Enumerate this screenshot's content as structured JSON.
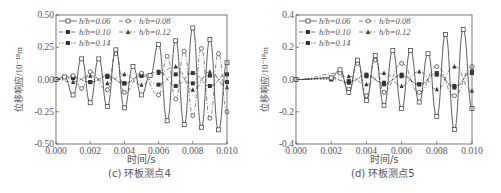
{
  "chart_data": [
    {
      "type": "line",
      "caption": "(c) 环板测点4",
      "xlabel": "时间/s",
      "ylabel": "位移响应/10⁻¹⁸m",
      "xlim": [
        0.0,
        0.01
      ],
      "ylim": [
        -0.5,
        0.5
      ],
      "xticks": [
        "0.000",
        "0.002",
        "0.004",
        "0.006",
        "0.008",
        "0.010"
      ],
      "yticks": [
        "0.50",
        "0.25",
        "0.00",
        "-0.25",
        "-0.50"
      ],
      "legend": [
        "h/b=0.06",
        "h/b=0.08",
        "h/b=0.10",
        "h/b=0.12",
        "h/b=0.14"
      ],
      "legend_position": "upper left",
      "series": [
        {
          "name": "h/b=0.06",
          "marker": "square-open",
          "line": "solid",
          "x": [
            0.0,
            0.0005,
            0.001,
            0.0015,
            0.002,
            0.0025,
            0.003,
            0.0035,
            0.004,
            0.0045,
            0.005,
            0.0055,
            0.006,
            0.0065,
            0.007,
            0.0075,
            0.008,
            0.0085,
            0.009,
            0.0095,
            0.01
          ],
          "y": [
            0.0,
            0.02,
            -0.12,
            0.16,
            -0.18,
            0.16,
            -0.21,
            0.23,
            -0.22,
            0.1,
            -0.12,
            0.03,
            0.27,
            -0.32,
            0.3,
            -0.35,
            0.4,
            -0.37,
            0.31,
            -0.39,
            0.13
          ]
        },
        {
          "name": "h/b=0.08",
          "marker": "circle-open",
          "line": "dash-dot",
          "x": [
            0.0,
            0.001,
            0.0015,
            0.002,
            0.003,
            0.0035,
            0.004,
            0.005,
            0.006,
            0.0065,
            0.007,
            0.0075,
            0.008,
            0.0085,
            0.009,
            0.0095,
            0.01
          ],
          "y": [
            0.0,
            0.03,
            -0.07,
            0.06,
            -0.08,
            0.2,
            -0.1,
            0.05,
            -0.12,
            0.18,
            -0.15,
            0.22,
            -0.28,
            0.24,
            -0.3,
            0.2,
            -0.25
          ]
        },
        {
          "name": "h/b=0.10",
          "marker": "square-filled",
          "line": "dashed",
          "x": [
            0.0,
            0.001,
            0.002,
            0.003,
            0.004,
            0.005,
            0.006,
            0.007,
            0.008,
            0.009,
            0.01
          ],
          "y": [
            0.0,
            0.02,
            -0.02,
            0.03,
            -0.03,
            0.03,
            0.06,
            -0.05,
            0.05,
            -0.05,
            0.04
          ]
        },
        {
          "name": "h/b=0.12",
          "marker": "triangle-filled",
          "line": "dash-dot",
          "x": [
            0.0,
            0.001,
            0.002,
            0.003,
            0.004,
            0.005,
            0.006,
            0.007,
            0.008,
            0.009,
            0.01
          ],
          "y": [
            0.0,
            -0.02,
            0.03,
            -0.03,
            0.04,
            -0.04,
            0.05,
            0.1,
            -0.08,
            0.06,
            -0.06
          ]
        },
        {
          "name": "h/b=0.14",
          "marker": "square-filled",
          "line": "dotted",
          "x": [
            0.0,
            0.001,
            0.002,
            0.003,
            0.004,
            0.005,
            0.006,
            0.007,
            0.008,
            0.009,
            0.01
          ],
          "y": [
            0.0,
            0.01,
            -0.02,
            0.02,
            -0.03,
            0.03,
            -0.04,
            0.04,
            -0.03,
            0.03,
            -0.02
          ]
        }
      ]
    },
    {
      "type": "line",
      "caption": "(d) 环板测点5",
      "xlabel": "时间/s",
      "ylabel": "位移响应/10⁻¹⁸m",
      "xlim": [
        0.0,
        0.01
      ],
      "ylim": [
        -0.4,
        0.4
      ],
      "xticks": [
        "0.000",
        "0.002",
        "0.004",
        "0.006",
        "0.008",
        "0.010"
      ],
      "yticks": [
        "0.4",
        "0.2",
        "0.0",
        "-0.2",
        "-0.4"
      ],
      "legend": [
        "h/b=0.06",
        "h/b=0.08",
        "h/b=0.10",
        "h/b=0.12",
        "h/b=0.14"
      ],
      "legend_position": "upper left",
      "series": [
        {
          "name": "h/b=0.06",
          "marker": "square-open",
          "line": "solid",
          "x": [
            0.0,
            0.002,
            0.0025,
            0.003,
            0.0035,
            0.004,
            0.0045,
            0.005,
            0.0055,
            0.006,
            0.0065,
            0.007,
            0.0075,
            0.008,
            0.0085,
            0.009,
            0.0095,
            0.01
          ],
          "y": [
            0.0,
            0.01,
            0.06,
            -0.08,
            0.12,
            -0.13,
            0.15,
            -0.16,
            0.18,
            -0.18,
            0.18,
            -0.14,
            0.16,
            -0.23,
            0.28,
            -0.31,
            0.31,
            -0.18
          ]
        },
        {
          "name": "h/b=0.08",
          "marker": "circle-open",
          "line": "dash-dot",
          "x": [
            0.0,
            0.0025,
            0.003,
            0.0035,
            0.004,
            0.0045,
            0.005,
            0.006,
            0.007,
            0.008,
            0.009,
            0.01
          ],
          "y": [
            0.0,
            0.04,
            -0.06,
            0.1,
            -0.1,
            0.12,
            -0.08,
            0.1,
            -0.08,
            0.08,
            -0.1,
            0.08
          ]
        },
        {
          "name": "h/b=0.10",
          "marker": "square-filled",
          "line": "dashed",
          "x": [
            0.0,
            0.002,
            0.003,
            0.004,
            0.005,
            0.006,
            0.007,
            0.008,
            0.009,
            0.01
          ],
          "y": [
            0.0,
            0.01,
            -0.02,
            0.03,
            -0.03,
            0.03,
            -0.03,
            0.04,
            -0.05,
            0.05
          ]
        },
        {
          "name": "h/b=0.12",
          "marker": "triangle-filled",
          "line": "dash-dot",
          "x": [
            0.0,
            0.002,
            0.003,
            0.004,
            0.005,
            0.006,
            0.007,
            0.008,
            0.009,
            0.01
          ],
          "y": [
            0.0,
            0.01,
            0.02,
            -0.03,
            0.04,
            -0.04,
            0.05,
            -0.06,
            0.08,
            -0.07
          ]
        },
        {
          "name": "h/b=0.14",
          "marker": "square-filled",
          "line": "dotted",
          "x": [
            0.0,
            0.002,
            0.003,
            0.004,
            0.005,
            0.006,
            0.007,
            0.008,
            0.009,
            0.01
          ],
          "y": [
            0.0,
            0.0,
            -0.01,
            0.02,
            -0.02,
            0.02,
            -0.03,
            0.03,
            -0.04,
            0.04
          ]
        }
      ]
    }
  ],
  "labels": {
    "left": {
      "caption": "(c) 环板测点4",
      "xlabel": "时间/s",
      "ylabel": "位移响应/10⁻¹⁸m"
    },
    "right": {
      "caption": "(d) 环板测点5",
      "xlabel": "时间/s",
      "ylabel": "位移响应/10⁻¹⁸m"
    }
  }
}
